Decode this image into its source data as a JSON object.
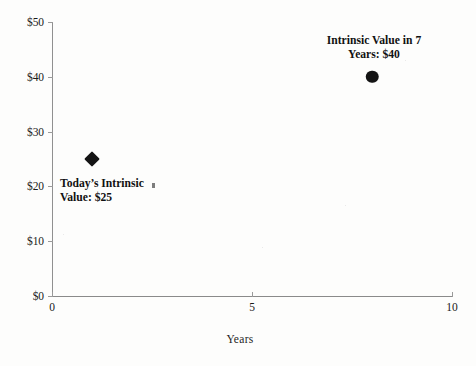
{
  "chart_data": {
    "type": "scatter",
    "title": "",
    "xlabel": "Years",
    "ylabel": "",
    "xlim": [
      0,
      10
    ],
    "ylim": [
      0,
      50
    ],
    "grid": false,
    "legend": "none",
    "x_ticks": [
      "0",
      "5",
      "10"
    ],
    "x_tick_values": [
      0,
      5,
      10
    ],
    "y_ticks": [
      "$0",
      "$10",
      "$20",
      "$30",
      "$40",
      "$50"
    ],
    "y_tick_values": [
      0,
      10,
      20,
      30,
      40,
      50
    ],
    "points": [
      {
        "name": "todays-intrinsic-value",
        "x": 1,
        "y": 25,
        "marker": "diamond",
        "color": "#141414",
        "label": "Today’s Intrinsic\nValue: $25"
      },
      {
        "name": "intrinsic-value-in-7-years",
        "x": 8,
        "y": 40,
        "marker": "circle",
        "color": "#141414",
        "label": "Intrinsic Value in 7\nYears: $40"
      }
    ],
    "annotations": [
      {
        "text": "Today’s Intrinsic\nValue: $25"
      },
      {
        "text": "Intrinsic Value in 7\nYears: $40"
      }
    ],
    "axis_color": "#8c8c8c",
    "background_color": "#fdfdfc"
  }
}
